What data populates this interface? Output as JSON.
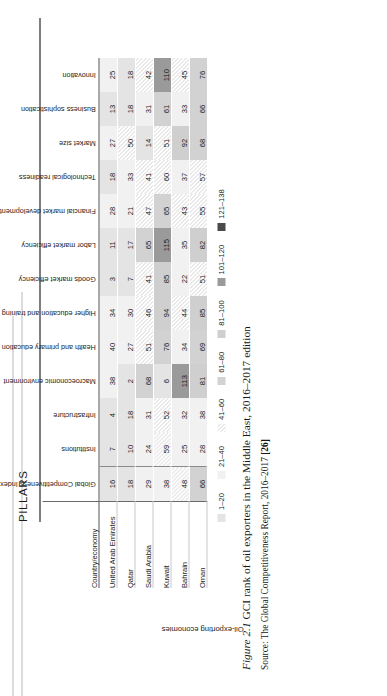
{
  "group_header": {
    "pillars_label": "PILLARS"
  },
  "table": {
    "row_group_label": "Oil-exporting economies",
    "country_column_header": "Country/economy",
    "columns": [
      "Global Competitiveness Index",
      "Institutions",
      "Infrastructure",
      "Macroeconomic environment",
      "Health and primary education",
      "Higher education and training",
      "Goods market efficiency",
      "Labor market efficiency",
      "Financial market development",
      "Technological readiness",
      "Market size",
      "Business sophistication",
      "Innovation"
    ],
    "rows": [
      {
        "country": "United Arab Emirates",
        "values": [
          16,
          7,
          4,
          38,
          40,
          34,
          3,
          11,
          28,
          18,
          27,
          13,
          25
        ]
      },
      {
        "country": "Qatar",
        "values": [
          18,
          10,
          18,
          2,
          27,
          30,
          7,
          17,
          21,
          33,
          50,
          18,
          18
        ]
      },
      {
        "country": "Saudi Arabia",
        "values": [
          29,
          24,
          31,
          68,
          51,
          46,
          41,
          65,
          47,
          41,
          14,
          31,
          42
        ]
      },
      {
        "country": "Kuwait",
        "values": [
          38,
          59,
          52,
          6,
          76,
          94,
          85,
          115,
          65,
          60,
          51,
          61,
          110
        ]
      },
      {
        "country": "Bahrain",
        "values": [
          48,
          25,
          32,
          113,
          34,
          44,
          22,
          35,
          43,
          37,
          92,
          33,
          45
        ]
      },
      {
        "country": "Oman",
        "values": [
          66,
          28,
          38,
          81,
          69,
          85,
          51,
          82,
          55,
          57,
          68,
          66,
          76
        ]
      }
    ]
  },
  "legend": {
    "items": [
      {
        "label": "1–20",
        "band": 1,
        "color": "#e4e4e4"
      },
      {
        "label": "21–40",
        "band": 2,
        "color": "#f1f1f1"
      },
      {
        "label": "41–60",
        "band": 3,
        "color": "#e9e9e9"
      },
      {
        "label": "61–80",
        "band": 4,
        "color": "#d2d2d2"
      },
      {
        "label": "81–100",
        "band": 5,
        "color": "#cfcfcf"
      },
      {
        "label": "101–120",
        "band": 6,
        "color": "#9a9a9a"
      },
      {
        "label": "121–138",
        "band": 7,
        "color": "#4a4a4a"
      }
    ]
  },
  "caption": {
    "figure_number": "Figure 2.1",
    "text": "GCI rank of oil exporters in the Middle East, 2016–2017 edition",
    "source_prefix": "Source: The Global Competitiveness Report, 2016–2017",
    "source_ref": "[26]"
  }
}
